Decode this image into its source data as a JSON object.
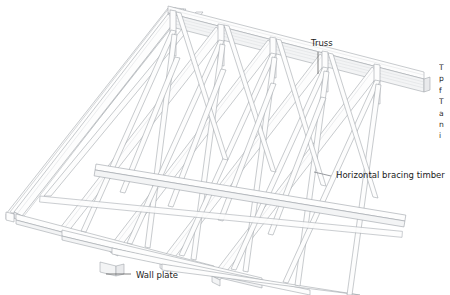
{
  "figure": {
    "name": "roof-truss-assembly",
    "style": "technical line illustration",
    "background_color": "#ffffff",
    "line_color": "#9aa0a6",
    "shade_color": "#f3f4f5"
  },
  "callouts": [
    {
      "id": "truss",
      "label": "Truss",
      "leader": "vertical",
      "text_x": 311,
      "text_y": 46,
      "points_to": "ridge area of the truss frames"
    },
    {
      "id": "horizontal-bracing-timber",
      "label": "Horizontal bracing timber",
      "leader": "diagonal",
      "text_x": 336,
      "text_y": 178,
      "points_to": "longitudinal timber across the bottom chords"
    },
    {
      "id": "wall-plate",
      "label": "Wall plate",
      "leader": "horizontal",
      "text_x": 136,
      "text_y": 278,
      "points_to": "timber plate at the foot of the rafters"
    }
  ],
  "edge_column": {
    "note": "body text column clipped at the right edge of the page",
    "lines": [
      "T",
      "p",
      "f",
      "T",
      "a",
      "n",
      "i"
    ]
  }
}
